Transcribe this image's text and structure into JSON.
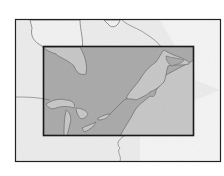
{
  "map": {
    "description": "Locator map of northeastern North America with highlighted region",
    "region_highlight": "Great Lakes, St. Lawrence and northeastern seaboard",
    "colors": {
      "background": "#ffffff",
      "land_outside": "#e8e8e8",
      "water_outside": "#f4f4f4",
      "land_highlight": "#a9a9a9",
      "water_highlight": "#c4c4c4",
      "border_line": "#555555",
      "frame": "#222222"
    },
    "frame": {
      "x": 15,
      "y": 19,
      "width": 206,
      "height": 143
    },
    "highlight_box": {
      "x": 43,
      "y": 46,
      "width": 151,
      "height": 90
    }
  }
}
